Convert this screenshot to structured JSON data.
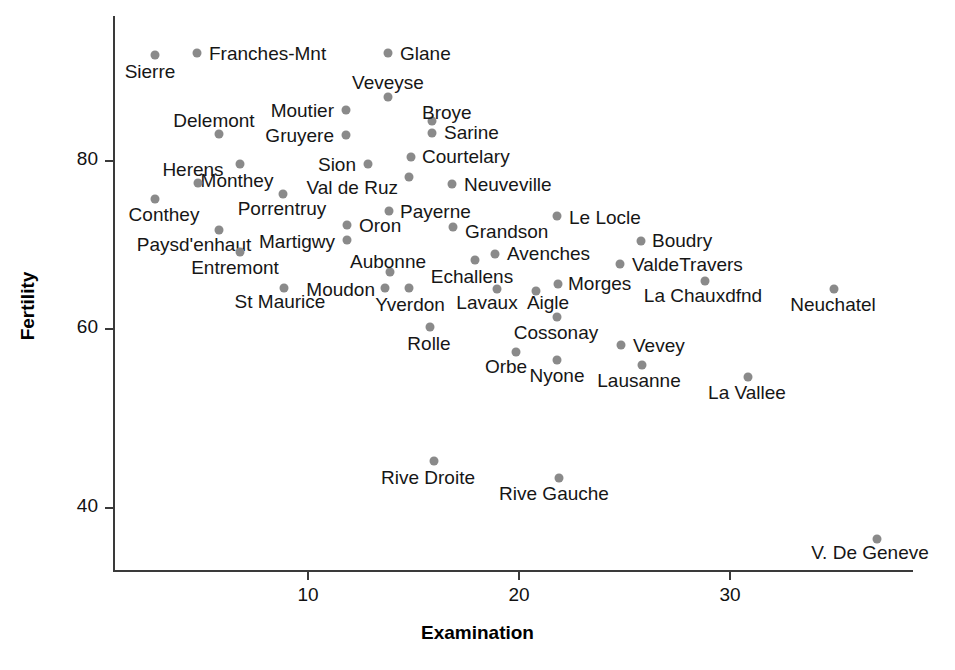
{
  "chart_data": {
    "type": "scatter",
    "title": "",
    "xlabel": "Examination",
    "ylabel": "Fertility",
    "xlim": [
      1.5,
      38
    ],
    "ylim": [
      33,
      93
    ],
    "xticks": [
      10,
      20,
      30
    ],
    "yticks": [
      40,
      60,
      80
    ],
    "grid": false,
    "legend": null,
    "point_color": "#8a8a8a",
    "label_color": "#161616",
    "axis_color": "#3a3a3a",
    "points": [
      {
        "label": "Sierre",
        "x": 3,
        "y": 92.2,
        "px": 155,
        "py": 55,
        "lx": 150,
        "ly": 72,
        "anchor": "middle"
      },
      {
        "label": "Franches-Mnt",
        "x": 5,
        "y": 92.5,
        "px": 197,
        "py": 53,
        "lx": 209,
        "ly": 54,
        "anchor": "start"
      },
      {
        "label": "Glane",
        "x": 14,
        "y": 92.4,
        "px": 388,
        "py": 53,
        "lx": 400,
        "ly": 54,
        "anchor": "start"
      },
      {
        "label": "Veveyse",
        "x": 14,
        "y": 87.1,
        "px": 388,
        "py": 97,
        "lx": 388,
        "ly": 83,
        "anchor": "middle"
      },
      {
        "label": "Moutier",
        "x": 12,
        "y": 85.8,
        "px": 346,
        "py": 110,
        "lx": 334,
        "ly": 111,
        "anchor": "end"
      },
      {
        "label": "Broye",
        "x": 16,
        "y": 84.6,
        "px": 432,
        "py": 121,
        "lx": 422,
        "ly": 113,
        "anchor": "start"
      },
      {
        "label": "Sarine",
        "x": 16,
        "y": 83.1,
        "px": 432,
        "py": 133,
        "lx": 444,
        "ly": 133,
        "anchor": "start"
      },
      {
        "label": "Delemont",
        "x": 6,
        "y": 83.1,
        "px": 219,
        "py": 134,
        "lx": 214,
        "ly": 121,
        "anchor": "middle"
      },
      {
        "label": "Gruyere",
        "x": 12,
        "y": 82.4,
        "px": 346,
        "py": 135,
        "lx": 334,
        "ly": 136,
        "anchor": "end"
      },
      {
        "label": "Courtelary",
        "x": 15,
        "y": 80.2,
        "px": 411,
        "py": 157,
        "lx": 422,
        "ly": 157,
        "anchor": "start"
      },
      {
        "label": "Sion",
        "x": 13,
        "y": 79.3,
        "px": 368,
        "py": 164,
        "lx": 356,
        "ly": 165,
        "anchor": "end"
      },
      {
        "label": "Monthey",
        "x": 7,
        "y": 79.4,
        "px": 240,
        "py": 164,
        "lx": 237,
        "ly": 181,
        "anchor": "middle"
      },
      {
        "label": "Herens",
        "x": 7,
        "y": 77.3,
        "px": 198,
        "py": 183,
        "lx": 193,
        "ly": 170,
        "anchor": "middle"
      },
      {
        "label": "Val de Ruz",
        "x": 14,
        "y": 77.6,
        "px": 409,
        "py": 177,
        "lx": 398,
        "ly": 188,
        "anchor": "end"
      },
      {
        "label": "Neuveville",
        "x": 17,
        "y": 76.9,
        "px": 452,
        "py": 184,
        "lx": 464,
        "ly": 185,
        "anchor": "start"
      },
      {
        "label": "Porrentruy",
        "x": 9,
        "y": 76.1,
        "px": 283,
        "py": 194,
        "lx": 282,
        "ly": 209,
        "anchor": "middle"
      },
      {
        "label": "Conthey",
        "x": 3,
        "y": 75.5,
        "px": 155,
        "py": 199,
        "lx": 164,
        "ly": 215,
        "anchor": "middle"
      },
      {
        "label": "Payerne",
        "x": 14,
        "y": 74.2,
        "px": 389,
        "py": 211,
        "lx": 400,
        "ly": 212,
        "anchor": "start"
      },
      {
        "label": "Le Locle",
        "x": 25,
        "y": 72.7,
        "px": 557,
        "py": 216,
        "lx": 569,
        "ly": 218,
        "anchor": "start"
      },
      {
        "label": "Oron",
        "x": 12,
        "y": 72.5,
        "px": 347,
        "py": 225,
        "lx": 359,
        "ly": 226,
        "anchor": "start"
      },
      {
        "label": "Paysd'enhaut",
        "x": 6,
        "y": 72.0,
        "px": 219,
        "py": 230,
        "lx": 194,
        "ly": 245,
        "anchor": "middle"
      },
      {
        "label": "Grandson",
        "x": 18,
        "y": 71.7,
        "px": 453,
        "py": 227,
        "lx": 465,
        "ly": 232,
        "anchor": "start"
      },
      {
        "label": "Martigwy",
        "x": 12,
        "y": 70.4,
        "px": 347,
        "py": 240,
        "lx": 335,
        "ly": 242,
        "anchor": "end"
      },
      {
        "label": "Boudry",
        "x": 27,
        "y": 70.4,
        "px": 641,
        "py": 241,
        "lx": 652,
        "ly": 241,
        "anchor": "start"
      },
      {
        "label": "Entremont",
        "x": 7,
        "y": 69.3,
        "px": 240,
        "py": 252,
        "lx": 235,
        "ly": 268,
        "anchor": "middle"
      },
      {
        "label": "Avenches",
        "x": 19,
        "y": 68.9,
        "px": 495,
        "py": 254,
        "lx": 507,
        "ly": 254,
        "anchor": "start"
      },
      {
        "label": "ValdeTravers",
        "x": 25,
        "y": 67.6,
        "px": 620,
        "py": 264,
        "lx": 632,
        "ly": 265,
        "anchor": "start"
      },
      {
        "label": "Echallens",
        "x": 18,
        "y": 68.3,
        "px": 475,
        "py": 260,
        "lx": 472,
        "ly": 277,
        "anchor": "middle"
      },
      {
        "label": "Aubonne",
        "x": 14,
        "y": 66.9,
        "px": 390,
        "py": 272,
        "lx": 388,
        "ly": 262,
        "anchor": "middle"
      },
      {
        "label": "La Chauxdfnd",
        "x": 29,
        "y": 65.7,
        "px": 705,
        "py": 281,
        "lx": 703,
        "ly": 296,
        "anchor": "middle"
      },
      {
        "label": "Morges",
        "x": 22,
        "y": 65.5,
        "px": 558,
        "py": 284,
        "lx": 568,
        "ly": 284,
        "anchor": "start"
      },
      {
        "label": "St Maurice",
        "x": 9,
        "y": 65.0,
        "px": 284,
        "py": 288,
        "lx": 280,
        "ly": 302,
        "anchor": "middle"
      },
      {
        "label": "Moudon",
        "x": 13,
        "y": 65.0,
        "px": 385,
        "py": 288,
        "lx": 375,
        "ly": 290,
        "anchor": "end"
      },
      {
        "label": "Yverdon",
        "x": 14,
        "y": 65.4,
        "px": 409,
        "py": 288,
        "lx": 410,
        "ly": 305,
        "anchor": "middle"
      },
      {
        "label": "Lavaux",
        "x": 19,
        "y": 65.1,
        "px": 497,
        "py": 289,
        "lx": 487,
        "ly": 303,
        "anchor": "middle"
      },
      {
        "label": "Aigle",
        "x": 21,
        "y": 64.1,
        "px": 536,
        "py": 291,
        "lx": 548,
        "ly": 303,
        "anchor": "middle"
      },
      {
        "label": "Neuchatel",
        "x": 34,
        "y": 64.4,
        "px": 834,
        "py": 289,
        "lx": 833,
        "ly": 305,
        "anchor": "middle"
      },
      {
        "label": "Cossonay",
        "x": 22,
        "y": 61.7,
        "px": 557,
        "py": 317,
        "lx": 556,
        "ly": 333,
        "anchor": "middle"
      },
      {
        "label": "Rolle",
        "x": 16,
        "y": 60.5,
        "px": 430,
        "py": 327,
        "lx": 429,
        "ly": 344,
        "anchor": "middle"
      },
      {
        "label": "Vevey",
        "x": 25,
        "y": 58.3,
        "px": 621,
        "py": 345,
        "lx": 633,
        "ly": 346,
        "anchor": "start"
      },
      {
        "label": "Orbe",
        "x": 20,
        "y": 57.4,
        "px": 516,
        "py": 352,
        "lx": 506,
        "ly": 367,
        "anchor": "middle"
      },
      {
        "label": "Nyone",
        "x": 22,
        "y": 56.6,
        "px": 557,
        "py": 360,
        "lx": 557,
        "ly": 376,
        "anchor": "middle"
      },
      {
        "label": "Lausanne",
        "x": 26,
        "y": 55.7,
        "px": 642,
        "py": 365,
        "lx": 639,
        "ly": 381,
        "anchor": "middle"
      },
      {
        "label": "La Vallee",
        "x": 31,
        "y": 54.3,
        "px": 748,
        "py": 377,
        "lx": 747,
        "ly": 393,
        "anchor": "middle"
      },
      {
        "label": "Rive Droite",
        "x": 16,
        "y": 44.7,
        "px": 434,
        "py": 461,
        "lx": 428,
        "ly": 478,
        "anchor": "middle"
      },
      {
        "label": "Rive Gauche",
        "x": 22,
        "y": 42.8,
        "px": 559,
        "py": 478,
        "lx": 554,
        "ly": 494,
        "anchor": "middle"
      },
      {
        "label": "V. De Geneve",
        "x": 37,
        "y": 35.0,
        "px": 877,
        "py": 539,
        "lx": 870,
        "ly": 553,
        "anchor": "middle"
      }
    ]
  },
  "axes": {
    "x_title": "Examination",
    "y_title": "Fertility",
    "x_tick_labels": [
      "10",
      "20",
      "30"
    ],
    "y_tick_labels": [
      "40",
      "60",
      "80"
    ],
    "x_tick_px": [
      307,
      518,
      729
    ],
    "y_tick_px": [
      507,
      328,
      160
    ]
  }
}
